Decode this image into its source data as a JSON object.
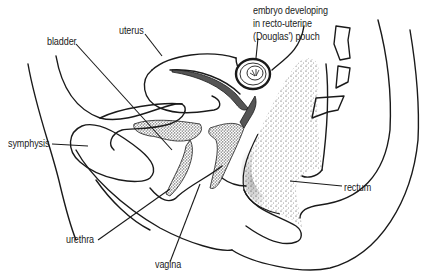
{
  "figure": {
    "type": "anatomical-line-drawing",
    "view": "sagittal section of female pelvis",
    "ink_color": "#1a1a1a",
    "background": "#ffffff",
    "labels": {
      "embryo": [
        "embryo developing",
        "in recto-uterine",
        "(Douglas') pouch"
      ],
      "uterus": "uterus",
      "bladder": "bladder",
      "symphysis": "symphysis",
      "rectum": "rectum",
      "urethra": "urethra",
      "vagina": "vagina"
    }
  }
}
